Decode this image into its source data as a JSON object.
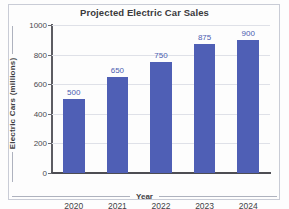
{
  "chart_data": {
    "type": "bar",
    "title": "Projected Electric Car Sales",
    "xlabel": "Year",
    "ylabel": "Electric Cars (millions)",
    "categories": [
      "2020",
      "2021",
      "2022",
      "2023",
      "2024"
    ],
    "values": [
      500,
      650,
      750,
      875,
      900
    ],
    "data_labels": [
      "500",
      "650",
      "750",
      "875",
      "900"
    ],
    "ylim": [
      0,
      1000
    ],
    "ytick_labels": [
      "0",
      "200",
      "400",
      "600",
      "800",
      "1000"
    ],
    "ytick_values": [
      0,
      200,
      400,
      600,
      800,
      1000
    ],
    "grid": "horizontal",
    "legend": "none",
    "series": [
      {
        "name": "Projected electric car sales",
        "values": [
          500,
          650,
          750,
          875,
          900
        ],
        "color": "#4f5fb5"
      }
    ],
    "colors": {
      "bar": "#4f5fb5",
      "data_label": "#4a5cb0",
      "gridline": "#dfe1e8",
      "axis": "#4d4d53",
      "title": "#3a3a3c",
      "background": "#fdfdfd"
    }
  }
}
